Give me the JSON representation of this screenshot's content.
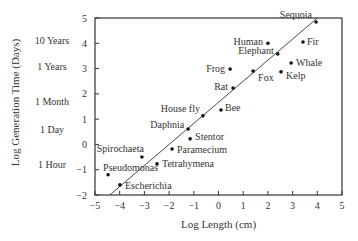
{
  "chart_data": {
    "type": "scatter",
    "title": "",
    "xlabel": "Log Length (cm)",
    "ylabel": "Log Generation Time (Days)",
    "xlim": [
      -5,
      5
    ],
    "ylim": [
      -2,
      5
    ],
    "grid": false,
    "x_ticks": [
      -5,
      -4,
      -3,
      -2,
      -1,
      0,
      1,
      2,
      3,
      4,
      5
    ],
    "y_ticks": [
      -2,
      -1,
      0,
      1,
      2,
      3,
      4,
      5
    ],
    "y_secondary_labels": [
      {
        "label": "10 Years",
        "y": 4.1
      },
      {
        "label": "1 Years",
        "y": 3.1
      },
      {
        "label": "1 Month",
        "y": 1.7
      },
      {
        "label": "1 Day",
        "y": 0.6
      },
      {
        "label": "1 Hour",
        "y": -0.8
      }
    ],
    "points": [
      {
        "name": "Sequoia",
        "x": 3.95,
        "y": 4.84
      },
      {
        "name": "Fir",
        "x": 3.42,
        "y": 4.05
      },
      {
        "name": "Human",
        "x": 2.0,
        "y": 4.0
      },
      {
        "name": "Elephant",
        "x": 2.4,
        "y": 3.58
      },
      {
        "name": "Whale",
        "x": 2.94,
        "y": 3.22
      },
      {
        "name": "Kelp",
        "x": 2.53,
        "y": 2.87
      },
      {
        "name": "Fox",
        "x": 1.4,
        "y": 2.9
      },
      {
        "name": "Frog",
        "x": 0.47,
        "y": 2.98
      },
      {
        "name": "Rat",
        "x": 0.59,
        "y": 2.23
      },
      {
        "name": "Bee",
        "x": 0.1,
        "y": 1.36
      },
      {
        "name": "House fly",
        "x": -0.63,
        "y": 1.13
      },
      {
        "name": "Daphnia",
        "x": -1.23,
        "y": 0.61
      },
      {
        "name": "Stentor",
        "x": -1.15,
        "y": 0.22
      },
      {
        "name": "Paramecium",
        "x": -1.88,
        "y": -0.18
      },
      {
        "name": "Spirochaeta",
        "x": -3.1,
        "y": -0.5
      },
      {
        "name": "Tetrahymena",
        "x": -2.49,
        "y": -0.77
      },
      {
        "name": "Pseudomonas",
        "x": -4.47,
        "y": -1.2
      },
      {
        "name": "Escherichia",
        "x": -3.99,
        "y": -1.6
      }
    ],
    "fit_line": {
      "x": [
        -4.4,
        4.0
      ],
      "y": [
        -2.0,
        5.0
      ]
    }
  }
}
